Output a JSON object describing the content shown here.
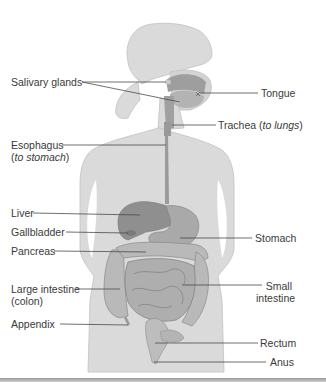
{
  "figure": {
    "labels_left": [
      {
        "id": "salivary-glands",
        "text": "Salivary glands"
      },
      {
        "id": "esophagus",
        "text": "Esophagus",
        "note_prefix": "(",
        "note": "to stomach",
        "note_suffix": ")"
      },
      {
        "id": "liver",
        "text": "Liver"
      },
      {
        "id": "gallbladder",
        "text": "Gallbladder"
      },
      {
        "id": "pancreas",
        "text": "Pancreas"
      },
      {
        "id": "large-intestine",
        "text": "Large intestine",
        "line2": "(colon)"
      },
      {
        "id": "appendix",
        "text": "Appendix"
      }
    ],
    "labels_right": [
      {
        "id": "tongue",
        "text": "Tongue"
      },
      {
        "id": "trachea",
        "text": "Trachea",
        "note_prefix": "(",
        "note": "to lungs",
        "note_suffix": ")"
      },
      {
        "id": "stomach",
        "text": "Stomach"
      },
      {
        "id": "small-intestine",
        "text": "Small",
        "line2": "intestine"
      },
      {
        "id": "rectum",
        "text": "Rectum"
      },
      {
        "id": "anus",
        "text": "Anus"
      }
    ]
  },
  "colors": {
    "body_fill": "#d9d9d9",
    "body_outline": "#bdbdbd",
    "organ_dark": "#8c8c8c",
    "organ_mid": "#a8a8a8",
    "organ_light": "#c4c4c4",
    "leader_line": "#4a4a4a",
    "label_text": "#3a3a3a"
  }
}
